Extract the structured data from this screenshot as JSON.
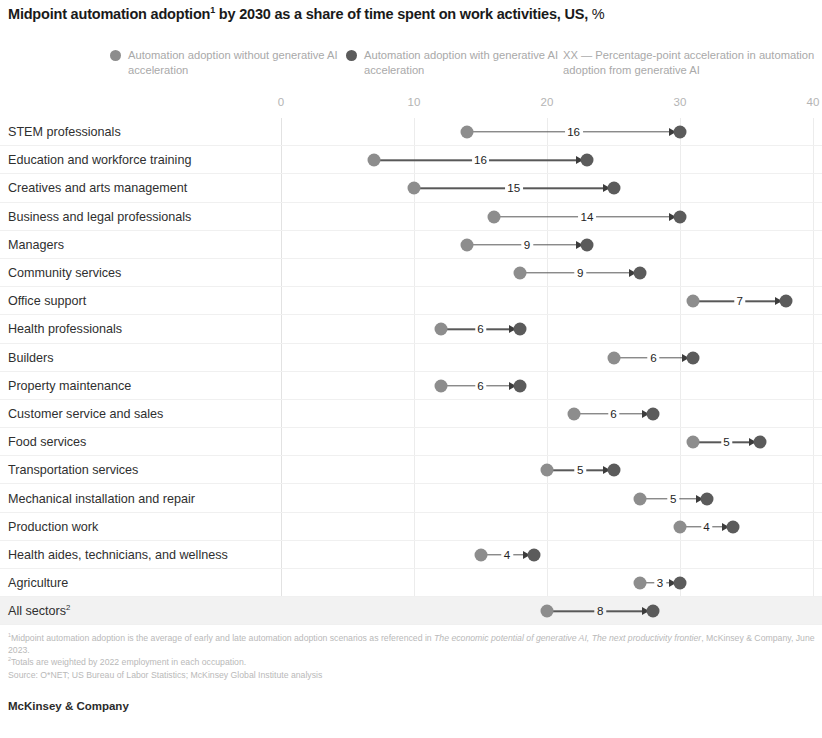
{
  "title": {
    "main": "Midpoint automation adoption",
    "footnote_marker": "1",
    "rest": " by 2030 as a share of time spent on work activities, US, ",
    "unit": "%"
  },
  "legend": [
    {
      "id": "without",
      "label": "Automation adoption without generative AI acceleration",
      "color": "#8d8d8d",
      "marker": "dot"
    },
    {
      "id": "with",
      "label": "Automation adoption with generative AI acceleration",
      "color": "#5b5b5b",
      "marker": "dot"
    },
    {
      "id": "delta",
      "label": "XX — Percentage-point acceleration in automation adoption from generative AI",
      "color": "#a9a9a9",
      "marker": "none"
    }
  ],
  "footnotes": {
    "note1_marker": "1",
    "note1_a": "Midpoint automation adoption is the average of early and late automation adoption scenarios as referenced in ",
    "note1_em": "The economic potential of generative AI, The next productivity frontier",
    "note1_b": ", McKinsey & Company, June 2023.",
    "note2_marker": "2",
    "note2": "Totals are weighted by 2022 employment in each occupation.",
    "source": "Source: O*NET; US Bureau of Labor Statistics; McKinsey Global Institute analysis"
  },
  "brand": "McKinsey & Company",
  "chart_data": {
    "type": "dumbbell",
    "title": "Midpoint automation adoption1 by 2030 as a share of time spent on work activities, US, %",
    "xlabel": "",
    "ylabel": "",
    "xlim": [
      0,
      40
    ],
    "ticks": [
      0,
      10,
      20,
      30,
      40
    ],
    "tick_labels": [
      "0",
      "10",
      "20",
      "30",
      "40"
    ],
    "grid": true,
    "legend_position": "top",
    "series": [
      {
        "name": "Automation adoption without generative AI acceleration",
        "color": "#8d8d8d"
      },
      {
        "name": "Automation adoption with generative AI acceleration",
        "color": "#5b5b5b"
      }
    ],
    "categories": [
      "STEM professionals",
      "Education and workforce training",
      "Creatives and arts management",
      "Business and legal professionals",
      "Managers",
      "Community services",
      "Office support",
      "Health professionals",
      "Builders",
      "Property maintenance",
      "Customer service and sales",
      "Food services",
      "Transportation services",
      "Mechanical installation and repair",
      "Production work",
      "Health aides, technicians, and wellness",
      "Agriculture",
      "All sectors"
    ],
    "rows": [
      {
        "label": "STEM professionals",
        "label_sup": "",
        "without": 14,
        "with": 30,
        "delta": "16",
        "highlight": false
      },
      {
        "label": "Education and workforce training",
        "label_sup": "",
        "without": 7,
        "with": 23,
        "delta": "16",
        "highlight": false
      },
      {
        "label": "Creatives and arts management",
        "label_sup": "",
        "without": 10,
        "with": 25,
        "delta": "15",
        "highlight": false
      },
      {
        "label": "Business and legal professionals",
        "label_sup": "",
        "without": 16,
        "with": 30,
        "delta": "14",
        "highlight": false
      },
      {
        "label": "Managers",
        "label_sup": "",
        "without": 14,
        "with": 23,
        "delta": "9",
        "highlight": false
      },
      {
        "label": "Community services",
        "label_sup": "",
        "without": 18,
        "with": 27,
        "delta": "9",
        "highlight": false
      },
      {
        "label": "Office support",
        "label_sup": "",
        "without": 31,
        "with": 38,
        "delta": "7",
        "highlight": false
      },
      {
        "label": "Health professionals",
        "label_sup": "",
        "without": 12,
        "with": 18,
        "delta": "6",
        "highlight": false
      },
      {
        "label": "Builders",
        "label_sup": "",
        "without": 25,
        "with": 31,
        "delta": "6",
        "highlight": false
      },
      {
        "label": "Property maintenance",
        "label_sup": "",
        "without": 12,
        "with": 18,
        "delta": "6",
        "highlight": false
      },
      {
        "label": "Customer service and sales",
        "label_sup": "",
        "without": 22,
        "with": 28,
        "delta": "6",
        "highlight": false
      },
      {
        "label": "Food services",
        "label_sup": "",
        "without": 31,
        "with": 36,
        "delta": "5",
        "highlight": false
      },
      {
        "label": "Transportation services",
        "label_sup": "",
        "without": 20,
        "with": 25,
        "delta": "5",
        "highlight": false
      },
      {
        "label": "Mechanical installation and repair",
        "label_sup": "",
        "without": 27,
        "with": 32,
        "delta": "5",
        "highlight": false
      },
      {
        "label": "Production work",
        "label_sup": "",
        "without": 30,
        "with": 34,
        "delta": "4",
        "highlight": false
      },
      {
        "label": "Health aides, technicians, and wellness",
        "label_sup": "",
        "without": 15,
        "with": 19,
        "delta": "4",
        "highlight": false
      },
      {
        "label": "Agriculture",
        "label_sup": "",
        "without": 27,
        "with": 30,
        "delta": "3",
        "highlight": false
      },
      {
        "label": "All sectors",
        "label_sup": "2",
        "without": 20,
        "with": 28,
        "delta": "8",
        "highlight": true
      }
    ]
  }
}
